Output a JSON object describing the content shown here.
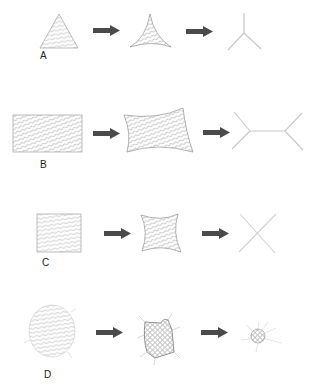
{
  "diagram": {
    "rows": [
      {
        "label": "A",
        "stages": [
          "triangle",
          "concave-triangle",
          "three-way-junction"
        ]
      },
      {
        "label": "B",
        "stages": [
          "rectangle",
          "concave-rectangle",
          "double-junction-line"
        ]
      },
      {
        "label": "C",
        "stages": [
          "square",
          "concave-square",
          "x-cross"
        ]
      },
      {
        "label": "D",
        "stages": [
          "circle",
          "irregular-contracted-blob",
          "small-spiky-blob"
        ]
      }
    ],
    "colors": {
      "arrow": "#444444",
      "hatch": "#8a8a8a",
      "outline": "#9a9a9a",
      "skeleton": "#c8c8c8"
    }
  }
}
